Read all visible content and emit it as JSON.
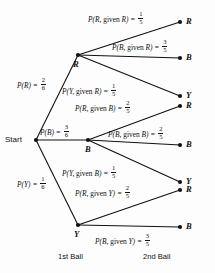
{
  "diagram": {
    "type": "probability-tree",
    "title": "",
    "start_label": "Start",
    "stage_captions": {
      "first": "1st Ball",
      "second": "2nd Ball"
    },
    "colors": {
      "ink": "#111111",
      "background": "#fdfdfd"
    },
    "first_ball": [
      {
        "id": "R",
        "node_label": "R",
        "prob_text": "P(R) = ",
        "numerator": "2",
        "denominator": "6",
        "value": 0.3333
      },
      {
        "id": "B",
        "node_label": "B",
        "prob_text": "P(B) = ",
        "numerator": "3",
        "denominator": "6",
        "value": 0.5
      },
      {
        "id": "Y",
        "node_label": "Y",
        "prob_text": "P(Y) = ",
        "numerator": "1",
        "denominator": "6",
        "value": 0.1667
      }
    ],
    "second_ball": [
      {
        "id": "RR",
        "prefix": "P(R, ",
        "given": "given",
        "suffix": " R) = ",
        "numerator": "1",
        "denominator": "5",
        "end_label": "R",
        "value": 0.2
      },
      {
        "id": "RB",
        "prefix": "P(B, ",
        "given": "given",
        "suffix": " R) = ",
        "numerator": "3",
        "denominator": "5",
        "end_label": "B",
        "value": 0.6
      },
      {
        "id": "RY",
        "prefix": "P(Y, ",
        "given": "given",
        "suffix": " R) = ",
        "numerator": "1",
        "denominator": "5",
        "end_label": "Y",
        "value": 0.2
      },
      {
        "id": "BR",
        "prefix": "P(R, ",
        "given": "given",
        "suffix": " B) = ",
        "numerator": "2",
        "denominator": "5",
        "end_label": "R",
        "value": 0.4
      },
      {
        "id": "BB",
        "prefix": "P(B, ",
        "given": "given",
        "suffix": " B) = ",
        "numerator": "2",
        "denominator": "5",
        "end_label": "B",
        "value": 0.4
      },
      {
        "id": "BY",
        "prefix": "P(Y, ",
        "given": "given",
        "suffix": " B) = ",
        "numerator": "1",
        "denominator": "5",
        "end_label": "Y",
        "value": 0.2
      },
      {
        "id": "YR",
        "prefix": "P(R, ",
        "given": "given",
        "suffix": " Y) = ",
        "numerator": "2",
        "denominator": "5",
        "end_label": "R",
        "value": 0.4
      },
      {
        "id": "YB",
        "prefix": "P(B, ",
        "given": "given",
        "suffix": " Y) = ",
        "numerator": "3",
        "denominator": "5",
        "end_label": "B",
        "value": 0.6
      }
    ],
    "endpoints": [
      {
        "label": "R"
      },
      {
        "label": "B"
      },
      {
        "label": "Y"
      },
      {
        "label": "R"
      },
      {
        "label": "B"
      },
      {
        "label": "Y"
      },
      {
        "label": "R"
      },
      {
        "label": "B"
      }
    ]
  }
}
